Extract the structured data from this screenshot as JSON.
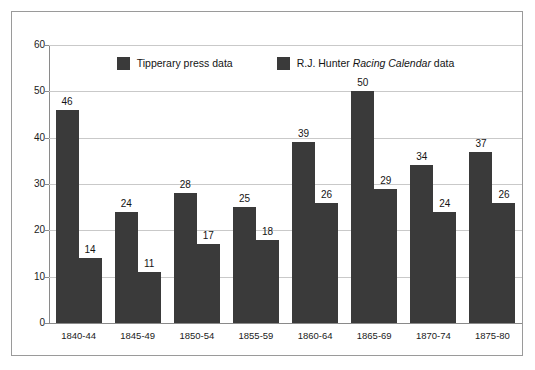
{
  "chart_data": {
    "type": "bar",
    "title": "",
    "subtitle": "",
    "xlabel": "",
    "ylabel": "",
    "ylim": [
      0,
      60
    ],
    "yticks": [
      0,
      10,
      20,
      30,
      40,
      50,
      60
    ],
    "grid": true,
    "legend_position": "top-center",
    "categories": [
      "1840-44",
      "1845-49",
      "1850-54",
      "1855-59",
      "1860-64",
      "1865-69",
      "1870-74",
      "1875-80"
    ],
    "series": [
      {
        "name": "Tipperary press data",
        "name_plain": "Tipperary press data",
        "color": "#3a3a3a",
        "values": [
          46,
          24,
          28,
          25,
          39,
          50,
          34,
          37
        ]
      },
      {
        "name": "R.J. Hunter Racing Calendar data",
        "name_prefix": "R.J. Hunter ",
        "name_italic": "Racing Calendar",
        "name_suffix": " data",
        "color": "#3a3a3a",
        "values": [
          14,
          11,
          17,
          18,
          26,
          29,
          24,
          26
        ]
      }
    ]
  },
  "style": {
    "bar_color": "#3a3a3a",
    "grid_color": "#c9c9c9",
    "axis_color": "#8a8a8a",
    "frame_color": "#9a9a9a",
    "background": "#ffffff",
    "text_color": "#141414"
  }
}
